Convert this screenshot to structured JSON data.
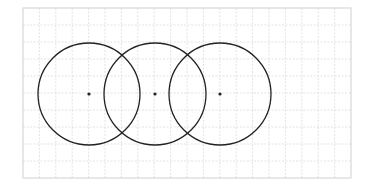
{
  "diagram": {
    "type": "overlapping-circles-on-grid",
    "grid": {
      "x": 23,
      "y": 8,
      "width": 328,
      "height": 170,
      "columns": 20,
      "rows": 10,
      "border_color": "#d0d0d0",
      "line_color": "#dadada"
    },
    "circles": [
      {
        "cx": 89,
        "cy": 94,
        "r": 51
      },
      {
        "cx": 155,
        "cy": 94,
        "r": 51
      },
      {
        "cx": 220,
        "cy": 94,
        "r": 51
      }
    ],
    "stroke_color": "#222222",
    "dot_color": "#222222"
  }
}
